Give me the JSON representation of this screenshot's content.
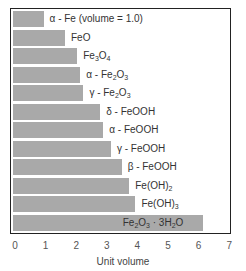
{
  "chart_data": {
    "type": "bar",
    "orientation": "horizontal",
    "title": "",
    "xlabel": "Unit volume",
    "ylabel": "",
    "xlim": [
      0,
      7
    ],
    "xticks": [
      0,
      1,
      2,
      3,
      4,
      5,
      6,
      7
    ],
    "grid": false,
    "legend": null,
    "bar_color": "#a9a9a9",
    "categories": [
      "α - Fe (volume = 1.0)",
      "FeO",
      "Fe3O4",
      "α - Fe2O3",
      "γ - Fe2O3",
      "δ - FeOOH",
      "α - FeOOH",
      "γ - FeOOH",
      "β - FeOOH",
      "Fe(OH)2",
      "Fe(OH)3",
      "Fe2O3 · 3H2O"
    ],
    "values": [
      1.0,
      1.7,
      2.1,
      2.2,
      2.3,
      2.85,
      2.95,
      3.2,
      3.55,
      3.8,
      4.0,
      6.2
    ]
  },
  "labels_html": [
    "α - Fe (volume = 1.0)",
    "FeO",
    "Fe<sub>3</sub>O<sub>4</sub>",
    "α - Fe<sub>2</sub>O<sub>3</sub>",
    "γ - Fe<sub>2</sub>O<sub>3</sub>",
    "δ - FeOOH",
    "α - FeOOH",
    "γ - FeOOH",
    "β - FeOOH",
    "Fe(OH)<sub>2</sub>",
    "Fe(OH)<sub>3</sub>",
    "Fe<sub>2</sub>O<sub>3</sub> · 3H<sub>2</sub>O"
  ]
}
